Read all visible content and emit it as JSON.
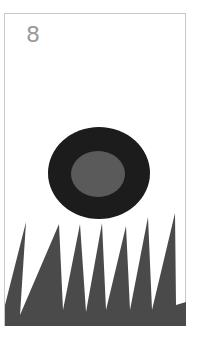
{
  "game": {
    "score": "8"
  },
  "colors": {
    "background": "#ffffff",
    "border": "#c8c8c8",
    "score_text": "#9a9a9a",
    "ball_outer": "#1c1c1c",
    "ball_inner": "#5a5a5a",
    "spikes": "#4a4a4a"
  },
  "ball": {
    "cx": 99,
    "cy": 173,
    "outer_rx": 51,
    "outer_ry": 46,
    "inner_cx": 98,
    "inner_cy": 174,
    "inner_rx": 27,
    "inner_ry": 23
  },
  "spikes": {
    "points": "5,326 5,305 26,222 20,315 59,224 63,310 80,224 86,312 102,223 106,310 126,226 130,310 148,217 152,310 175,213 176,305 186,302 186,326"
  }
}
